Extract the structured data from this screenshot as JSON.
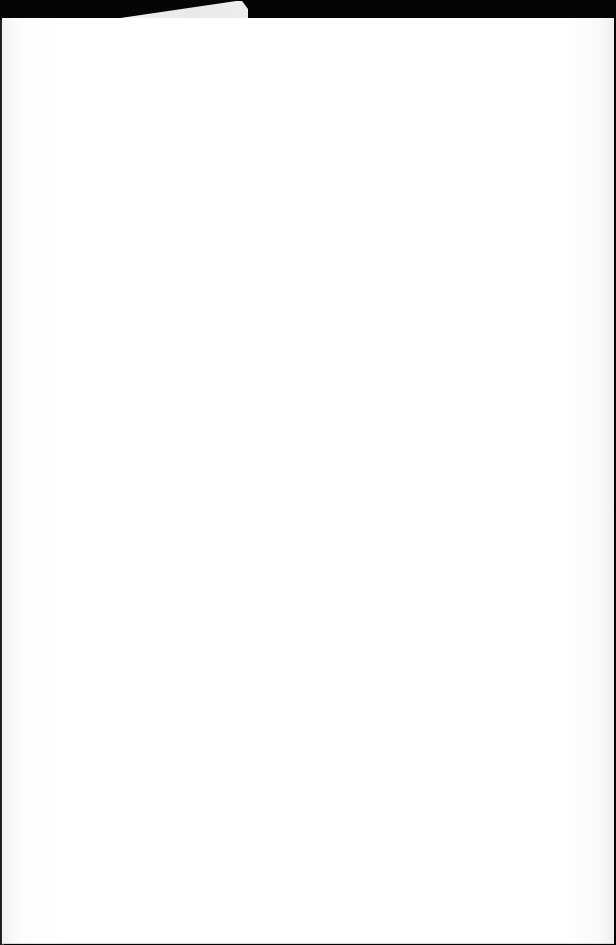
{
  "document": {
    "type": "blank page",
    "text": "",
    "colors": {
      "background": "#000000",
      "paper": "#ffffff",
      "tab": "#efefef"
    }
  }
}
